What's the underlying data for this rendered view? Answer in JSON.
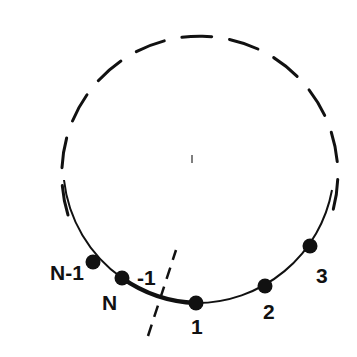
{
  "diagram": {
    "colors": {
      "ink": "#111111",
      "background": "#ffffff"
    },
    "circle": {
      "cx": 197,
      "cy": 164,
      "r": 138
    },
    "sites": [
      {
        "id": "site-n-minus-1",
        "label": "N-1",
        "x": 93,
        "y": 262,
        "lx": 50,
        "ly": 280
      },
      {
        "id": "site-n",
        "label": "N",
        "x": 122,
        "y": 278,
        "lx": 102,
        "ly": 310
      },
      {
        "id": "site-1",
        "label": "1",
        "x": 196,
        "y": 303,
        "lx": 191,
        "ly": 333
      },
      {
        "id": "site-2",
        "label": "2",
        "x": 265,
        "y": 286,
        "lx": 263,
        "ly": 318
      },
      {
        "id": "site-3",
        "label": "3",
        "x": 310,
        "y": 246,
        "lx": 316,
        "ly": 283
      }
    ],
    "boundary_label": {
      "text": "-1",
      "x": 137,
      "y": 285
    },
    "center_tick": {
      "x": 192,
      "y": 159
    }
  }
}
